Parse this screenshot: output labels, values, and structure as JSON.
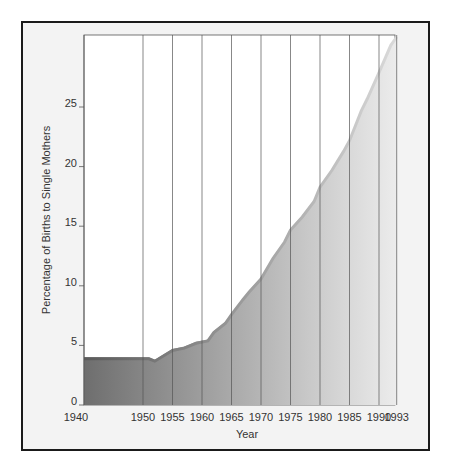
{
  "chart_data": {
    "type": "area",
    "title": "",
    "xlabel": "Year",
    "ylabel": "Percentage of Births to Single Mothers",
    "xlim": [
      1940,
      1993
    ],
    "ylim": [
      0,
      31
    ],
    "grid": "vertical lines at labeled years",
    "legend": null,
    "x_ticks": [
      1940,
      1950,
      1955,
      1960,
      1965,
      1970,
      1975,
      1980,
      1985,
      1990,
      1993
    ],
    "x_tick_labels": [
      "1940",
      "1950",
      "1955",
      "1960",
      "1965",
      "1970",
      "1975",
      "1980",
      "1985",
      "1990",
      "1993"
    ],
    "y_ticks": [
      0,
      5,
      10,
      15,
      20,
      25
    ],
    "y_tick_labels": [
      "0",
      "5",
      "10",
      "15",
      "20",
      "25"
    ],
    "x": [
      1940,
      1950,
      1951,
      1952,
      1955,
      1957,
      1959,
      1960,
      1961,
      1962,
      1964,
      1965,
      1967,
      1968,
      1970,
      1972,
      1974,
      1975,
      1977,
      1979,
      1980,
      1982,
      1984,
      1985,
      1987,
      1988,
      1990,
      1992,
      1993
    ],
    "series": [
      {
        "name": "Percentage of Births to Single Mothers",
        "values": [
          4.0,
          4.0,
          4.0,
          3.8,
          4.7,
          4.9,
          5.3,
          5.4,
          5.5,
          6.2,
          7.0,
          7.7,
          9.0,
          9.6,
          10.7,
          12.4,
          13.8,
          14.8,
          15.9,
          17.2,
          18.4,
          19.8,
          21.4,
          22.3,
          24.8,
          25.8,
          28.0,
          30.3,
          31.0
        ]
      }
    ],
    "fill_gradient": [
      "#6e6e6e",
      "#ececec"
    ]
  },
  "labels": {
    "xlabel": "Year",
    "ylabel": "Percentage of Births to Single Mothers"
  }
}
